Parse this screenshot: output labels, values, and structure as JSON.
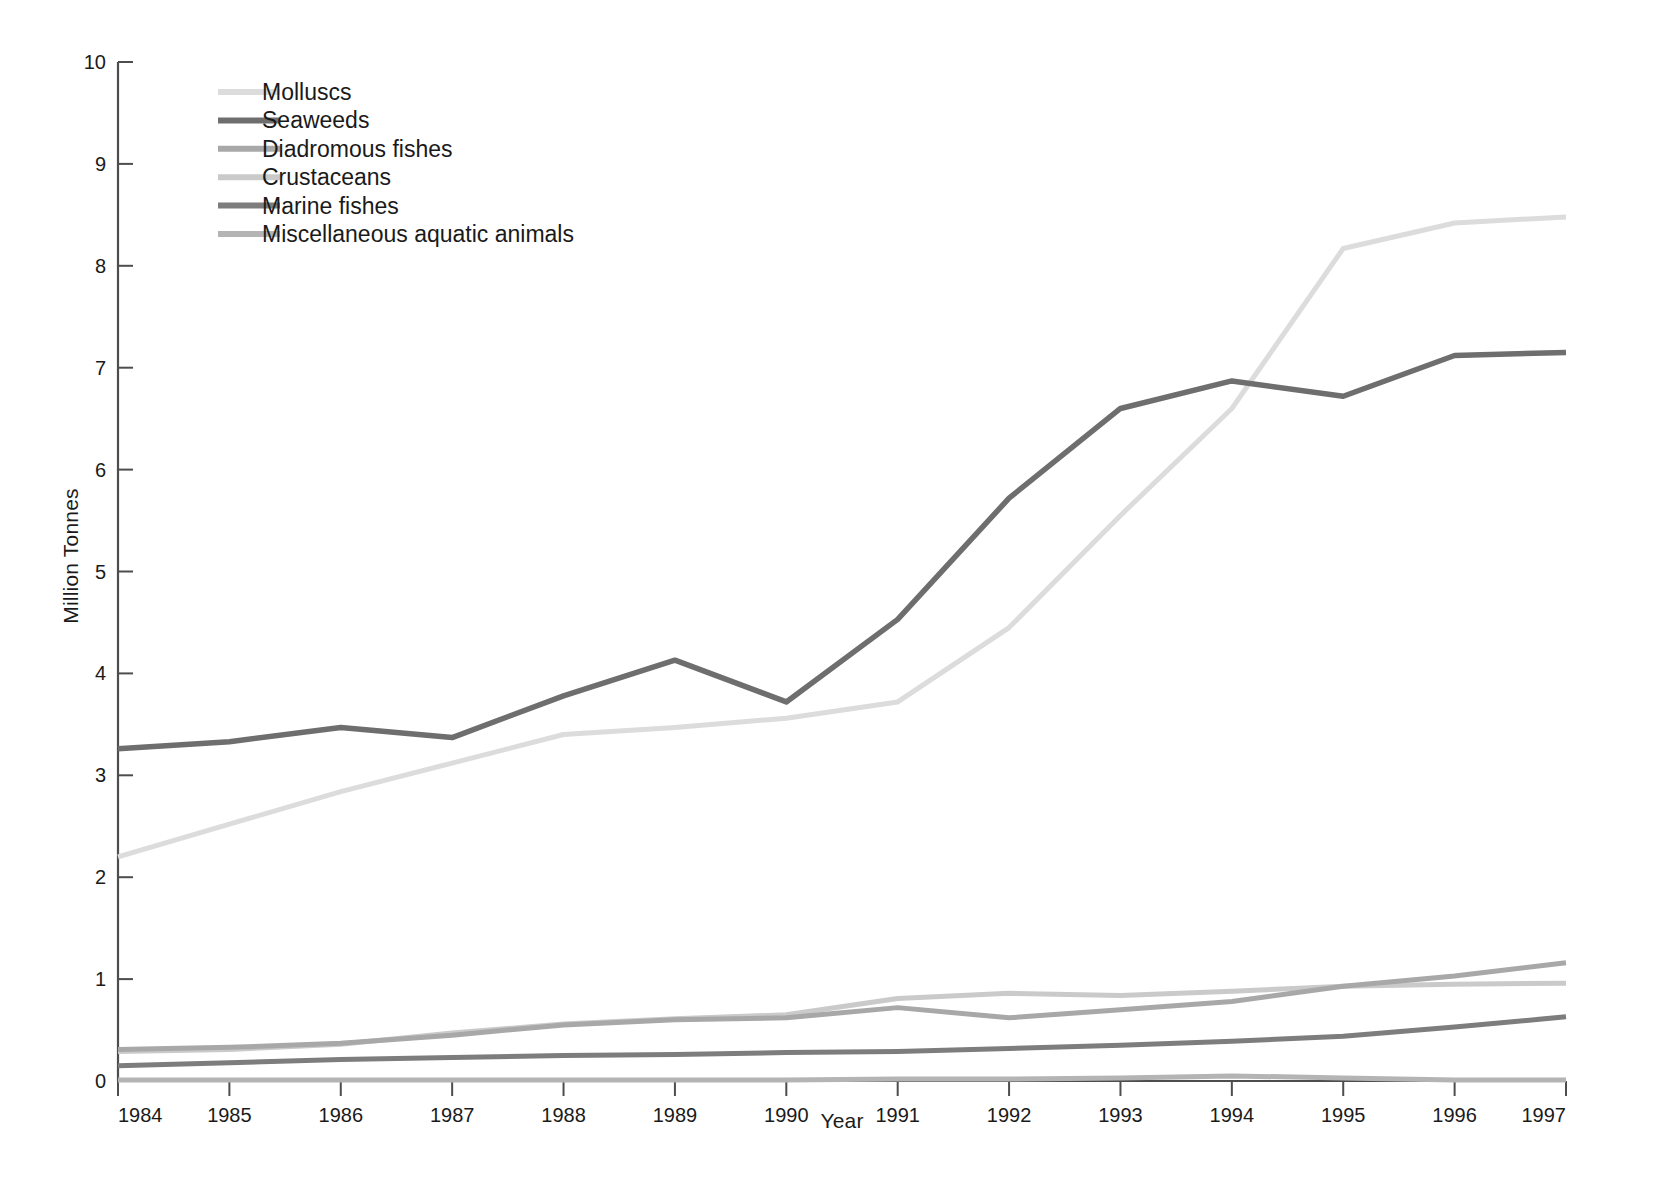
{
  "chart_data": {
    "type": "line",
    "title": "",
    "xlabel": "Year",
    "ylabel": "Million Tonnes",
    "x": [
      1984,
      1985,
      1986,
      1987,
      1988,
      1989,
      1990,
      1991,
      1992,
      1993,
      1994,
      1995,
      1996,
      1997
    ],
    "categories": [
      "1984",
      "1985",
      "1986",
      "1987",
      "1988",
      "1989",
      "1990",
      "1991",
      "1992",
      "1993",
      "1994",
      "1995",
      "1996",
      "1997"
    ],
    "xlim": [
      1984,
      1997
    ],
    "ylim": [
      0,
      10
    ],
    "ytick_labels": [
      "0",
      "1",
      "2",
      "3",
      "4",
      "5",
      "6",
      "7",
      "8",
      "9",
      "10"
    ],
    "yticks": [
      0,
      1,
      2,
      3,
      4,
      5,
      6,
      7,
      8,
      9,
      10
    ],
    "grid": false,
    "legend_position": "top-left inside",
    "series": [
      {
        "name": "Molluscs",
        "color": "#dcdcdc",
        "width": 5,
        "values": [
          2.2,
          2.52,
          2.84,
          3.12,
          3.4,
          3.47,
          3.56,
          3.72,
          4.45,
          5.55,
          6.6,
          8.17,
          8.42,
          8.48
        ]
      },
      {
        "name": "Seaweeds",
        "color": "#6e6e6e",
        "width": 5.5,
        "values": [
          3.26,
          3.33,
          3.47,
          3.37,
          3.78,
          4.13,
          3.72,
          4.53,
          5.72,
          6.6,
          6.87,
          6.72,
          7.12,
          7.15
        ]
      },
      {
        "name": "Diadromous fishes",
        "color": "#a8a8a8",
        "width": 5,
        "values": [
          0.31,
          0.33,
          0.37,
          0.45,
          0.55,
          0.6,
          0.62,
          0.72,
          0.62,
          0.7,
          0.78,
          0.93,
          1.03,
          1.16
        ]
      },
      {
        "name": "Crustaceans",
        "color": "#cacaca",
        "width": 5,
        "values": [
          0.29,
          0.31,
          0.36,
          0.47,
          0.56,
          0.61,
          0.65,
          0.81,
          0.86,
          0.84,
          0.88,
          0.93,
          0.95,
          0.96
        ]
      },
      {
        "name": "Marine fishes",
        "color": "#7d7d7d",
        "width": 5,
        "values": [
          0.15,
          0.18,
          0.21,
          0.23,
          0.25,
          0.26,
          0.28,
          0.29,
          0.32,
          0.35,
          0.39,
          0.44,
          0.53,
          0.63
        ]
      },
      {
        "name": "Miscellaneous aquatic animals",
        "color": "#b4b4b4",
        "width": 5,
        "values": [
          0.01,
          0.01,
          0.01,
          0.01,
          0.01,
          0.01,
          0.01,
          0.02,
          0.02,
          0.03,
          0.05,
          0.03,
          0.01,
          0.01
        ]
      }
    ]
  },
  "legend": {
    "items": [
      {
        "label": "Molluscs",
        "color": "#dcdcdc"
      },
      {
        "label": "Seaweeds",
        "color": "#6e6e6e"
      },
      {
        "label": "Diadromous fishes",
        "color": "#a8a8a8"
      },
      {
        "label": "Crustaceans",
        "color": "#cacaca"
      },
      {
        "label": "Marine fishes",
        "color": "#7d7d7d"
      },
      {
        "label": "Miscellaneous aquatic animals",
        "color": "#b4b4b4"
      }
    ]
  },
  "axes": {
    "y_title": "Million Tonnes",
    "x_title": "Year"
  }
}
